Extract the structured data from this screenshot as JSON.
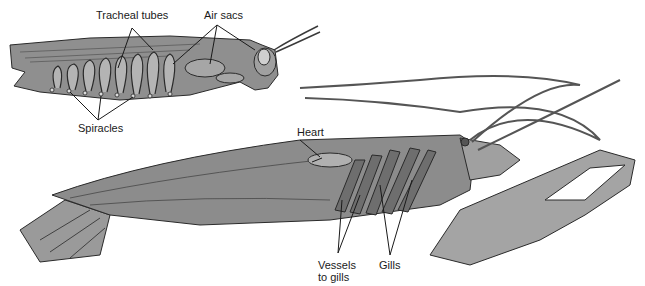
{
  "diagram": {
    "colors": {
      "body_fill": "#8c8c8c",
      "body_light": "#a8a8a8",
      "outline": "#2a2a2a",
      "background": "#ffffff",
      "label_text": "#1a1a1a"
    },
    "insect": {
      "labels": {
        "tracheal_tubes": "Tracheal tubes",
        "air_sacs": "Air sacs",
        "spiracles": "Spiracles"
      }
    },
    "crustacean": {
      "labels": {
        "heart": "Heart",
        "vessels_line1": "Vessels",
        "vessels_line2": "to gills",
        "gills": "Gills"
      }
    }
  }
}
